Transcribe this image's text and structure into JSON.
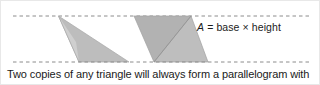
{
  "figure": {
    "formula": {
      "variable": "A",
      "expression": " = base × height",
      "full_text": "A = base × height"
    },
    "caption": "Two copies of any triangle will always form a parallelogram with",
    "colors": {
      "background": "#ffffff",
      "text": "#1a1a1a",
      "dashed_line": "#8c8c8c",
      "triangle_light": "#c9c9c9",
      "triangle_mid": "#b4b4b4",
      "triangle_dark": "#a3a3a3",
      "outline": "#9a9a9a",
      "border": "#e8e8e8"
    },
    "guides": [
      {
        "name": "top-dashed-guide",
        "y": 15
      },
      {
        "name": "bottom-dashed-guide",
        "y": 61
      }
    ],
    "shapes": [
      {
        "name": "single-triangle",
        "kind": "triangle",
        "points": "57.5,15 128,61 78,61",
        "fill": "#bdbdbd"
      },
      {
        "name": "single-triangle-highlight",
        "kind": "triangle",
        "points": "57.5,15 78,61 76,40",
        "fill": "#cdcdcd"
      },
      {
        "name": "parallelogram-upper-triangle",
        "kind": "triangle",
        "points": "133,15 190,15 153,61",
        "fill": "#b0b0b0"
      },
      {
        "name": "parallelogram-lower-triangle",
        "kind": "triangle",
        "points": "190,15 207,61 153,61",
        "fill": "#bcbcbc"
      },
      {
        "name": "parallelogram-diagonal",
        "kind": "line",
        "from": "153,61",
        "to": "190,15"
      }
    ]
  }
}
